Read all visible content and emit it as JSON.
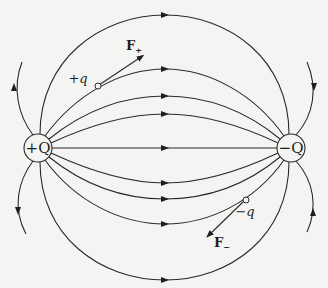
{
  "diagram": {
    "source_charge": {
      "label": "+Q",
      "sign": "positive"
    },
    "sink_charge": {
      "label": "−Q",
      "sign": "negative"
    },
    "test_charges": [
      {
        "label": "+q",
        "force_label": "F",
        "force_subscript": "+",
        "force_direction": "along field line"
      },
      {
        "label": "−q",
        "force_label": "F",
        "force_subscript": "−",
        "force_direction": "opposite field line"
      }
    ],
    "field_line_count_between": 9,
    "outer_field_lines": 4,
    "colors": {
      "ink": "#2a2a2a",
      "paper": "#f4f4f2"
    }
  }
}
